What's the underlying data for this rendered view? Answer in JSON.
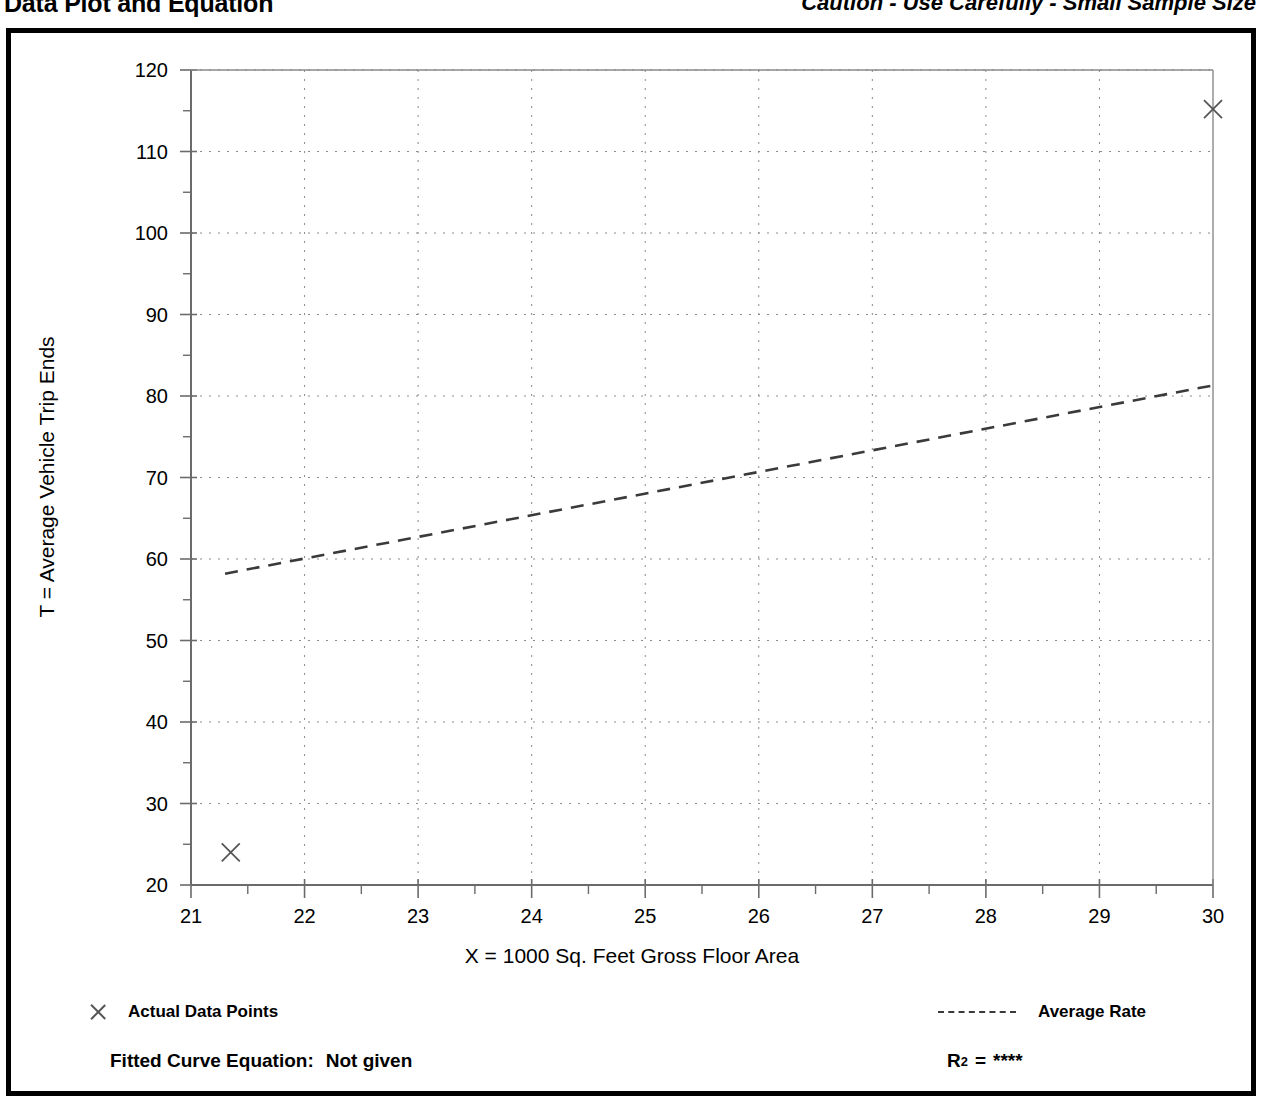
{
  "header": {
    "title": "Data Plot and Equation",
    "caution": "Caution - Use Carefully - Small Sample Size"
  },
  "legend": {
    "points_label": "Actual Data Points",
    "rate_label": "Average Rate",
    "point_marker_icon": "x-marker-icon",
    "rate_line_icon": "dashed-line-icon"
  },
  "footer": {
    "equation_label": "Fitted Curve Equation:",
    "equation_value": "Not given",
    "r2_label": "R",
    "r2_exponent": "2",
    "r2_equals": "=",
    "r2_value": "****"
  },
  "chart_data": {
    "type": "scatter",
    "title": "Data Plot and Equation",
    "subtitle": "Caution - Use Carefully - Small Sample Size",
    "xlabel": "X = 1000 Sq. Feet Gross Floor Area",
    "ylabel": "T = Average Vehicle Trip Ends",
    "xlim": [
      21,
      30
    ],
    "ylim": [
      20,
      120
    ],
    "grid": true,
    "grid_style": "dotted",
    "legend_position": "below-plot",
    "x_ticks": [
      21,
      22,
      23,
      24,
      25,
      26,
      27,
      28,
      29,
      30
    ],
    "x_tick_labels": [
      "21",
      "22",
      "23",
      "24",
      "25",
      "26",
      "27",
      "28",
      "29",
      "30"
    ],
    "x_minor_tick_step": 0.5,
    "y_ticks": [
      20,
      30,
      40,
      50,
      60,
      70,
      80,
      90,
      100,
      110,
      120
    ],
    "y_tick_labels": [
      "20",
      "30",
      "40",
      "50",
      "60",
      "70",
      "80",
      "90",
      "100",
      "110",
      "120"
    ],
    "y_minor_tick_step": 5,
    "series": [
      {
        "name": "Actual Data Points",
        "type": "scatter",
        "marker": "x",
        "color": "#555555",
        "points": [
          {
            "x": 21.35,
            "y": 24.0
          },
          {
            "x": 30.0,
            "y": 115.2
          }
        ]
      },
      {
        "name": "Average Rate",
        "type": "line",
        "style": "dashed",
        "color": "#3a3a3a",
        "points": [
          {
            "x": 21.3,
            "y": 58.2
          },
          {
            "x": 30.0,
            "y": 81.3
          }
        ]
      }
    ],
    "annotations": [
      {
        "text": "Fitted Curve Equation:  Not given"
      },
      {
        "text": "R2 = ****"
      }
    ]
  }
}
